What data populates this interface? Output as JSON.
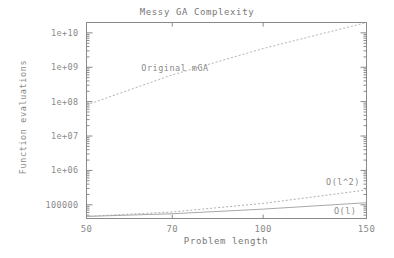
{
  "chart_data": {
    "type": "line",
    "title": "Messy GA Complexity",
    "xlabel": "Problem length",
    "ylabel": "Function evaluations",
    "xscale": "log",
    "yscale": "log",
    "xlim": [
      50,
      150
    ],
    "ylim": [
      40000,
      20000000000
    ],
    "grid": false,
    "legend_position": "inline-annotations",
    "xticks": [
      "50",
      "70",
      "100",
      "150"
    ],
    "xtick_values": [
      50,
      70,
      100,
      150
    ],
    "yticks": [
      "100000",
      "1e+06",
      "1e+07",
      "1e+08",
      "1e+09",
      "1e+10"
    ],
    "ytick_values": [
      100000,
      1000000,
      10000000,
      100000000,
      1000000000,
      10000000000
    ],
    "series": [
      {
        "name": "Original mGA",
        "annotation": "Original mGA",
        "x": [
          50,
          70,
          100,
          150
        ],
        "values": [
          80000000,
          600000000,
          3500000000,
          20000000000
        ]
      },
      {
        "name": "O(l^2)",
        "annotation": "O(l^2)",
        "x": [
          50,
          70,
          100,
          150
        ],
        "values": [
          46000,
          62000,
          110000,
          270000
        ]
      },
      {
        "name": "O(l)",
        "annotation": "O(l)",
        "x": [
          50,
          70,
          100,
          150
        ],
        "values": [
          46000,
          55000,
          75000,
          115000
        ]
      }
    ],
    "annotations": [
      {
        "text": "Original mGA",
        "x": 62,
        "y": 900000000
      },
      {
        "text": "O(l^2)",
        "x": 128,
        "y": 430000
      },
      {
        "text": "O(l)",
        "x": 132,
        "y": 62000
      }
    ]
  },
  "colors": {
    "axis": "#8a8a8a",
    "text": "#808080",
    "series_mga": "#b4b4b4",
    "series_l2": "#b0b0b0",
    "series_l": "#a8a8a8",
    "background": "#ffffff"
  }
}
